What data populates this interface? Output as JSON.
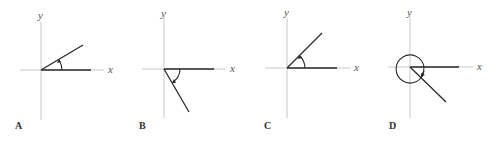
{
  "figure": {
    "panels": [
      {
        "id": "A",
        "label": "A",
        "x_axis_label": "x",
        "y_axis_label": "y",
        "rotation": "counterclockwise",
        "terminal_quadrant": "I",
        "approx_angle_deg": 30
      },
      {
        "id": "B",
        "label": "B",
        "x_axis_label": "x",
        "y_axis_label": "y",
        "rotation": "clockwise",
        "terminal_quadrant": "IV",
        "approx_angle_deg": -60
      },
      {
        "id": "C",
        "label": "C",
        "x_axis_label": "x",
        "y_axis_label": "y",
        "rotation": "counterclockwise",
        "terminal_quadrant": "I",
        "approx_angle_deg": 45
      },
      {
        "id": "D",
        "label": "D",
        "x_axis_label": "x",
        "y_axis_label": "y",
        "rotation": "counterclockwise",
        "terminal_quadrant": "IV",
        "approx_angle_deg": 315
      }
    ]
  }
}
